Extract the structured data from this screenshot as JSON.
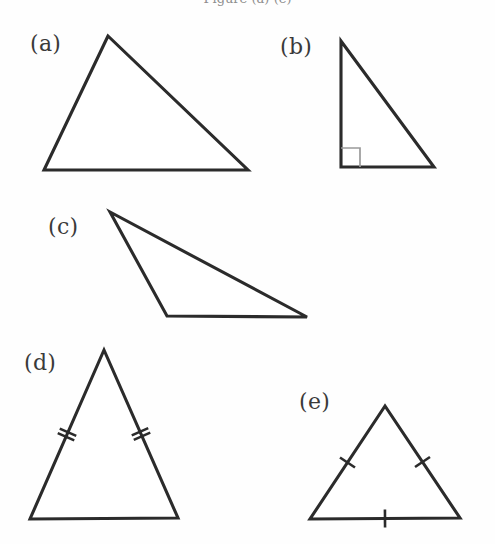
{
  "figure": {
    "caption_clipped": "Figure (a)-(e)",
    "background_color": "#fefefe",
    "line_color": "#2b2b2b",
    "mark_color": "#9a9a9a",
    "width": 495,
    "height": 544
  },
  "labels": {
    "a": "(a)",
    "b": "(b)",
    "c": "(c)",
    "d": "(d)",
    "e": "(e)"
  },
  "chart_data": {
    "type": "diagram",
    "items": [
      {
        "key": "a",
        "label": "(a)",
        "label_x": 30,
        "label_y": 33,
        "classification": "scalene-acute",
        "vertices": [
          [
            108,
            36
          ],
          [
            44,
            170
          ],
          [
            248,
            170
          ]
        ],
        "ticks": [],
        "right_angle": null
      },
      {
        "key": "b",
        "label": "(b)",
        "label_x": 280,
        "label_y": 36,
        "classification": "right",
        "vertices": [
          [
            341,
            41
          ],
          [
            341,
            167
          ],
          [
            434,
            167
          ]
        ],
        "ticks": [],
        "right_angle": {
          "corner": [
            341,
            167
          ],
          "size": 19
        }
      },
      {
        "key": "c",
        "label": "(c)",
        "label_x": 48,
        "label_y": 216,
        "classification": "obtuse-scalene",
        "vertices": [
          [
            110,
            212
          ],
          [
            167,
            316
          ],
          [
            307,
            317
          ]
        ],
        "ticks": [],
        "right_angle": null
      },
      {
        "key": "d",
        "label": "(d)",
        "label_x": 24,
        "label_y": 352,
        "classification": "isosceles",
        "vertices": [
          [
            104,
            350
          ],
          [
            30,
            519
          ],
          [
            178,
            518
          ]
        ],
        "ticks": [
          {
            "side": "left",
            "count": 2
          },
          {
            "side": "right",
            "count": 2
          }
        ],
        "right_angle": null
      },
      {
        "key": "e",
        "label": "(e)",
        "label_x": 299,
        "label_y": 391,
        "classification": "equilateral",
        "vertices": [
          [
            385,
            406
          ],
          [
            310,
            519
          ],
          [
            460,
            518
          ]
        ],
        "ticks": [
          {
            "side": "left",
            "count": 1
          },
          {
            "side": "right",
            "count": 1
          },
          {
            "side": "base",
            "count": 1
          }
        ],
        "right_angle": null
      }
    ]
  }
}
